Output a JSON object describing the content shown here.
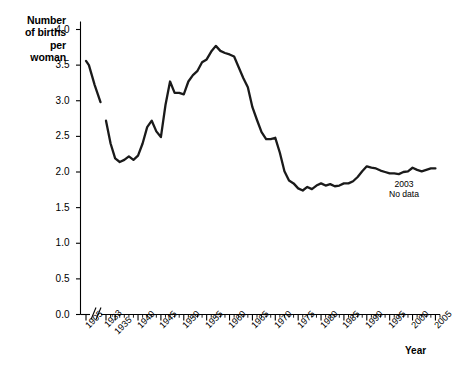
{
  "chart_data": {
    "type": "line",
    "title": "",
    "ylabel": "Number\nof births\nper\nwoman",
    "xlabel": "Year",
    "ylim": [
      0.0,
      4.0
    ],
    "ytick_labels": [
      "0.0",
      "0.5",
      "1.0",
      "1.5",
      "2.0",
      "2.5",
      "3.0",
      "3.5",
      "4.0"
    ],
    "ytick_values": [
      0.0,
      0.5,
      1.0,
      1.5,
      2.0,
      2.5,
      3.0,
      3.5,
      4.0
    ],
    "xtick_labels": [
      "1905",
      "1933",
      "1935",
      "1940",
      "1945",
      "1950",
      "1955",
      "1960",
      "1965",
      "1970",
      "1975",
      "1980",
      "1985",
      "1990",
      "1995",
      "2000",
      "2005"
    ],
    "xtick_values": [
      1905,
      1933,
      1935,
      1940,
      1945,
      1950,
      1955,
      1960,
      1965,
      1970,
      1975,
      1980,
      1985,
      1990,
      1995,
      2000,
      2005
    ],
    "xlim": [
      1905,
      2006
    ],
    "axis_break": {
      "after": 1905,
      "before": 1933,
      "marker": "//"
    },
    "grid": false,
    "legend": null,
    "line_color": "#1a1a1a",
    "annotations": [
      {
        "text": "2003\nNo data",
        "x": 2002,
        "y": 1.93
      }
    ],
    "series": [
      {
        "name": "Births per woman, 1905-1910",
        "x": [
          1905,
          1906,
          1907,
          1908,
          1909,
          1910
        ],
        "values": [
          3.56,
          3.5,
          3.36,
          3.22,
          3.1,
          2.98
        ]
      },
      {
        "name": "Births per woman, 1933-2005",
        "x": [
          1933,
          1934,
          1935,
          1936,
          1937,
          1938,
          1939,
          1940,
          1941,
          1942,
          1943,
          1944,
          1945,
          1946,
          1947,
          1948,
          1949,
          1950,
          1951,
          1952,
          1953,
          1954,
          1955,
          1956,
          1957,
          1958,
          1959,
          1960,
          1961,
          1962,
          1963,
          1964,
          1965,
          1966,
          1967,
          1968,
          1969,
          1970,
          1971,
          1972,
          1973,
          1974,
          1975,
          1976,
          1977,
          1978,
          1979,
          1980,
          1981,
          1982,
          1983,
          1984,
          1985,
          1986,
          1987,
          1988,
          1989,
          1990,
          1991,
          1992,
          1993,
          1994,
          1995,
          1996,
          1997,
          1998,
          1999,
          2000,
          2001,
          2002,
          2004,
          2005
        ],
        "values": [
          2.72,
          2.4,
          2.19,
          2.14,
          2.17,
          2.22,
          2.17,
          2.23,
          2.4,
          2.63,
          2.72,
          2.57,
          2.49,
          2.94,
          3.27,
          3.11,
          3.11,
          3.09,
          3.27,
          3.36,
          3.42,
          3.54,
          3.58,
          3.69,
          3.77,
          3.7,
          3.67,
          3.65,
          3.62,
          3.47,
          3.32,
          3.19,
          2.91,
          2.73,
          2.56,
          2.46,
          2.46,
          2.48,
          2.27,
          2.01,
          1.88,
          1.84,
          1.77,
          1.74,
          1.79,
          1.76,
          1.81,
          1.84,
          1.81,
          1.83,
          1.8,
          1.81,
          1.84,
          1.84,
          1.87,
          1.93,
          2.01,
          2.08,
          2.06,
          2.05,
          2.02,
          2.0,
          1.98,
          1.98,
          1.97,
          2.0,
          2.01,
          2.06,
          2.03,
          2.01,
          2.05,
          2.05
        ]
      }
    ]
  },
  "chart_labels": {
    "y_axis_title": "Number\nof births\nper\nwoman",
    "x_axis_title": "Year",
    "no_data_note": "2003\nNo data"
  }
}
